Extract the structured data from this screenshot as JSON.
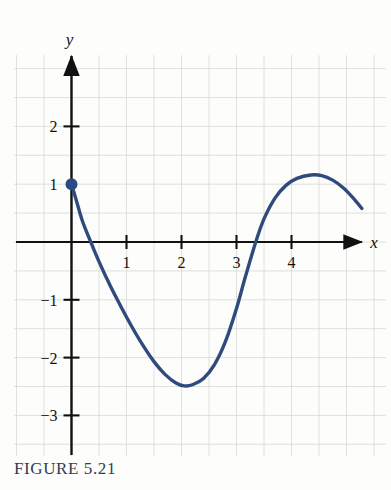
{
  "figure": {
    "caption": "FIGURE 5.21",
    "caption_color": "#2e3c55",
    "background_color": "#fdfdfc"
  },
  "chart_data": {
    "type": "line",
    "title": "",
    "subtitle": "",
    "xlabel": "x",
    "ylabel": "y",
    "xlim": [
      -1.05,
      5.35
    ],
    "ylim": [
      -3.75,
      2.95
    ],
    "x_ticks": [
      1,
      2,
      3,
      4
    ],
    "x_tick_labels": [
      "1",
      "2",
      "3",
      "4"
    ],
    "y_ticks": [
      2,
      1,
      -1,
      -2,
      -3
    ],
    "y_tick_labels": [
      "2",
      "1",
      "−1",
      "−2",
      "−3"
    ],
    "grid": true,
    "grid_spacing": 0.5,
    "grid_color": "#d8d8d8",
    "legend": "none",
    "axis_color": "#111111",
    "series": [
      {
        "name": "curve",
        "color": "#2f4a7c",
        "line_width": 3.4,
        "points": [
          [
            0.0,
            1.0
          ],
          [
            0.1,
            0.68
          ],
          [
            0.2,
            0.36
          ],
          [
            0.35,
            0.0
          ],
          [
            0.5,
            -0.34
          ],
          [
            0.7,
            -0.75
          ],
          [
            0.9,
            -1.12
          ],
          [
            1.1,
            -1.47
          ],
          [
            1.3,
            -1.79
          ],
          [
            1.5,
            -2.07
          ],
          [
            1.7,
            -2.29
          ],
          [
            1.9,
            -2.44
          ],
          [
            2.05,
            -2.49
          ],
          [
            2.2,
            -2.47
          ],
          [
            2.4,
            -2.36
          ],
          [
            2.6,
            -2.12
          ],
          [
            2.8,
            -1.72
          ],
          [
            3.0,
            -1.15
          ],
          [
            3.15,
            -0.64
          ],
          [
            3.35,
            0.0
          ],
          [
            3.5,
            0.4
          ],
          [
            3.7,
            0.76
          ],
          [
            3.9,
            0.98
          ],
          [
            4.1,
            1.1
          ],
          [
            4.35,
            1.16
          ],
          [
            4.55,
            1.15
          ],
          [
            4.75,
            1.07
          ],
          [
            4.95,
            0.93
          ],
          [
            5.15,
            0.73
          ],
          [
            5.28,
            0.58
          ]
        ]
      }
    ],
    "annotations": [
      {
        "type": "point",
        "name": "initial-value-dot",
        "x": 0,
        "y": 1,
        "filled": true,
        "color": "#2a4a86",
        "radius": 5
      }
    ]
  }
}
